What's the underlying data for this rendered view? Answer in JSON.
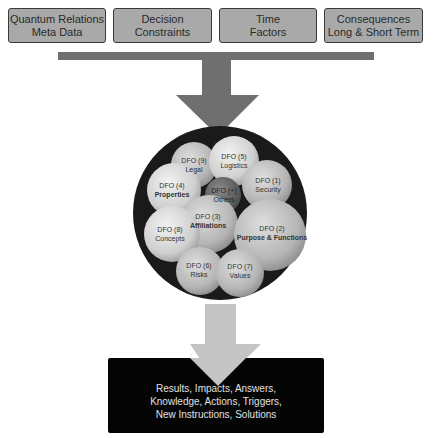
{
  "inputs": [
    {
      "line1": "Quantum Relations",
      "line2": "Meta Data"
    },
    {
      "line1": "Decision",
      "line2": "Constraints"
    },
    {
      "line1": "Time",
      "line2": "Factors"
    },
    {
      "line1": "Consequences",
      "line2": "Long & Short Term"
    }
  ],
  "bubbles": [
    {
      "id": "DFO (9)",
      "label": "Legal"
    },
    {
      "id": "DFO (5)",
      "label": "Logistics"
    },
    {
      "id": "DFO (4)",
      "label": "Properties"
    },
    {
      "id": "DFO (+)",
      "label": "Others"
    },
    {
      "id": "DFO (1)",
      "label": "Security"
    },
    {
      "id": "DFO (3)",
      "label": "Affiliations"
    },
    {
      "id": "DFO (2)",
      "label": "Purpose & Functions"
    },
    {
      "id": "DFO (8)",
      "label": "Concepts"
    },
    {
      "id": "DFO (6)",
      "label": "Risks"
    },
    {
      "id": "DFO (7)",
      "label": "Values"
    }
  ],
  "output": {
    "line1": "Results, Impacts, Answers,",
    "line2": "Knowledge, Actions, Triggers,",
    "line3": "New Instructions, Solutions"
  },
  "colors": {
    "input_box": "#a9a9a9",
    "bar": "#6f6f6f",
    "top_arrow": "#6f6f6f",
    "bottom_arrow": "#c4c4c4",
    "circle_bg": "#1a1a1a",
    "output_box": "#050505"
  }
}
